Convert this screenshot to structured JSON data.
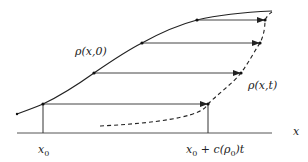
{
  "diagram": {
    "labels": {
      "initial_curve": "ρ(x,0)",
      "evolved_curve": "ρ(x,t)",
      "axis": "x",
      "x0": "x",
      "x0_sub": "0",
      "shifted_point": "x",
      "shifted_point_sub": "0",
      "shifted_point_rest": " + c(ρ",
      "shifted_point_sub2": "0",
      "shifted_point_tail": ")t"
    },
    "colors": {
      "curve": "#222222",
      "arrow": "#333333",
      "axis": "#444444"
    },
    "arrows": [
      {
        "from": [
          43,
          104
        ],
        "to": [
          208,
          104
        ]
      },
      {
        "from": [
          94,
          73
        ],
        "to": [
          241,
          73
        ]
      },
      {
        "from": [
          142,
          43
        ],
        "to": [
          260,
          43
        ]
      },
      {
        "from": [
          197,
          20
        ],
        "to": [
          265,
          20
        ]
      }
    ]
  }
}
